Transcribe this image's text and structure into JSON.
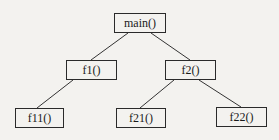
{
  "diagram": {
    "type": "call-tree",
    "nodes": [
      {
        "id": "main",
        "label": "main()"
      },
      {
        "id": "f1",
        "label": "f1()"
      },
      {
        "id": "f2",
        "label": "f2()"
      },
      {
        "id": "f11",
        "label": "f11()"
      },
      {
        "id": "f21",
        "label": "f21()"
      },
      {
        "id": "f22",
        "label": "f22()"
      }
    ],
    "edges": [
      {
        "from": "main",
        "to": "f1"
      },
      {
        "from": "main",
        "to": "f2"
      },
      {
        "from": "f1",
        "to": "f11"
      },
      {
        "from": "f2",
        "to": "f21"
      },
      {
        "from": "f2",
        "to": "f22"
      }
    ],
    "colors": {
      "line": "#333333",
      "background": "#f3f2ef"
    }
  }
}
